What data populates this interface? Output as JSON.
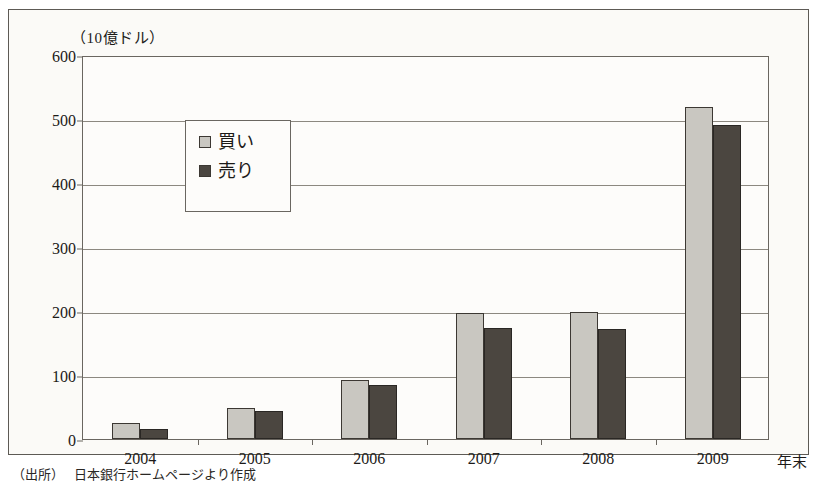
{
  "chart_data": {
    "type": "bar",
    "title": "",
    "subtitle": "",
    "unit_label": "（10億ドル）",
    "xlabel": "年末",
    "ylabel": "",
    "categories": [
      "2004",
      "2005",
      "2006",
      "2007",
      "2008",
      "2009"
    ],
    "series": [
      {
        "name": "買い",
        "color": "#c9c7c1",
        "values": [
          25,
          48,
          92,
          197,
          198,
          519
        ]
      },
      {
        "name": "売り",
        "color": "#4b4640",
        "values": [
          16,
          43,
          84,
          174,
          172,
          491
        ]
      }
    ],
    "ylim": [
      0,
      600
    ],
    "ytick_values": [
      0,
      100,
      200,
      300,
      400,
      500,
      600
    ],
    "ytick_labels": [
      "0",
      "100",
      "200",
      "300",
      "400",
      "500",
      "600"
    ],
    "grid": true,
    "legend_position": "upper-left"
  },
  "legend": {
    "items": [
      {
        "label": "買い",
        "swatch": "#c9c7c1"
      },
      {
        "label": "売り",
        "swatch": "#4b4640"
      }
    ]
  },
  "source": {
    "label": "（出所）",
    "text": "日本銀行ホームページより作成"
  }
}
